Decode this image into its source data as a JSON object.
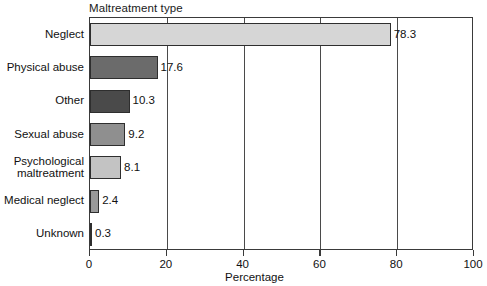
{
  "chart_data": {
    "type": "bar",
    "orientation": "horizontal",
    "title": "Maltreatment type",
    "xlabel": "Percentage",
    "ylabel": "",
    "xlim": [
      0,
      100
    ],
    "xticks": [
      0,
      20,
      40,
      60,
      80,
      100
    ],
    "xtick_labels": [
      "0",
      "20",
      "40",
      "60",
      "80",
      "100"
    ],
    "grid": true,
    "grid_axis": "x",
    "legend": false,
    "categories": [
      "Neglect",
      "Physical abuse",
      "Other",
      "Sexual abuse",
      "Psychological maltreatment",
      "Medical neglect",
      "Unknown"
    ],
    "values": [
      78.3,
      17.6,
      10.3,
      9.2,
      8.1,
      2.4,
      0.3
    ],
    "value_labels": [
      "78.3",
      "17.6",
      "10.3",
      "9.2",
      "8.1",
      "2.4",
      "0.3"
    ],
    "bar_colors": [
      "#d6d6d6",
      "#6b6b6b",
      "#4a4a4a",
      "#8f8f8f",
      "#c3c3c3",
      "#9a9a9a",
      "#3a3a3a"
    ],
    "bar_edge_color": "#2e2e2e",
    "axis_color": "#3a3a3a",
    "text_color": "#111111",
    "background": "#ffffff",
    "bars": [
      {
        "category": "Neglect",
        "value": 78.3,
        "label": "78.3",
        "color": "#d6d6d6"
      },
      {
        "category": "Physical abuse",
        "value": 17.6,
        "label": "17.6",
        "color": "#6b6b6b"
      },
      {
        "category": "Other",
        "value": 10.3,
        "label": "10.3",
        "color": "#4a4a4a"
      },
      {
        "category": "Sexual abuse",
        "value": 9.2,
        "label": "9.2",
        "color": "#8f8f8f"
      },
      {
        "category": "Psychological maltreatment",
        "value": 8.1,
        "label": "8.1",
        "color": "#c3c3c3",
        "label_lines": [
          "Psychological",
          "maltreatment"
        ]
      },
      {
        "category": "Medical neglect",
        "value": 2.4,
        "label": "2.4",
        "color": "#9a9a9a"
      },
      {
        "category": "Unknown",
        "value": 0.3,
        "label": "0.3",
        "color": "#3a3a3a"
      }
    ]
  }
}
